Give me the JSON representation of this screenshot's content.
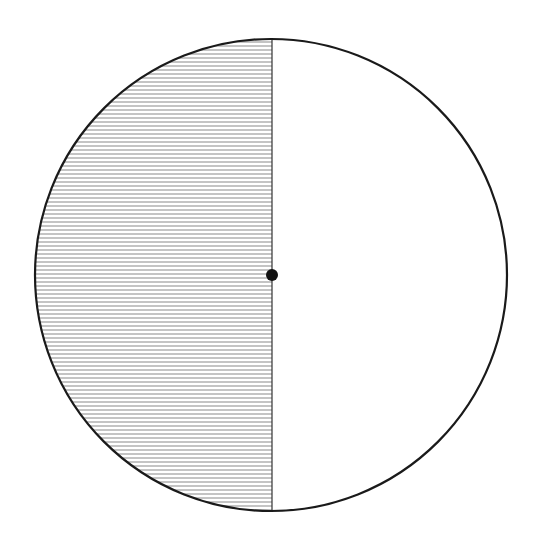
{
  "diagram": {
    "type": "circle-half-shaded",
    "canvas": {
      "width": 544,
      "height": 546
    },
    "circle": {
      "cx": 271,
      "cy": 275,
      "r": 236,
      "stroke": "#1a1a1a",
      "stroke_width": 2.2,
      "fill": "#ffffff"
    },
    "shaded_half": {
      "side": "left",
      "pattern": "horizontal-lines",
      "line_spacing": 4,
      "line_color": "#8a8a8a",
      "line_width": 1
    },
    "divider": {
      "orientation": "vertical",
      "x": 272,
      "stroke": "#333333",
      "stroke_width": 1.2
    },
    "center_point": {
      "cx": 272,
      "cy": 275,
      "r": 6,
      "fill": "#111111"
    }
  }
}
